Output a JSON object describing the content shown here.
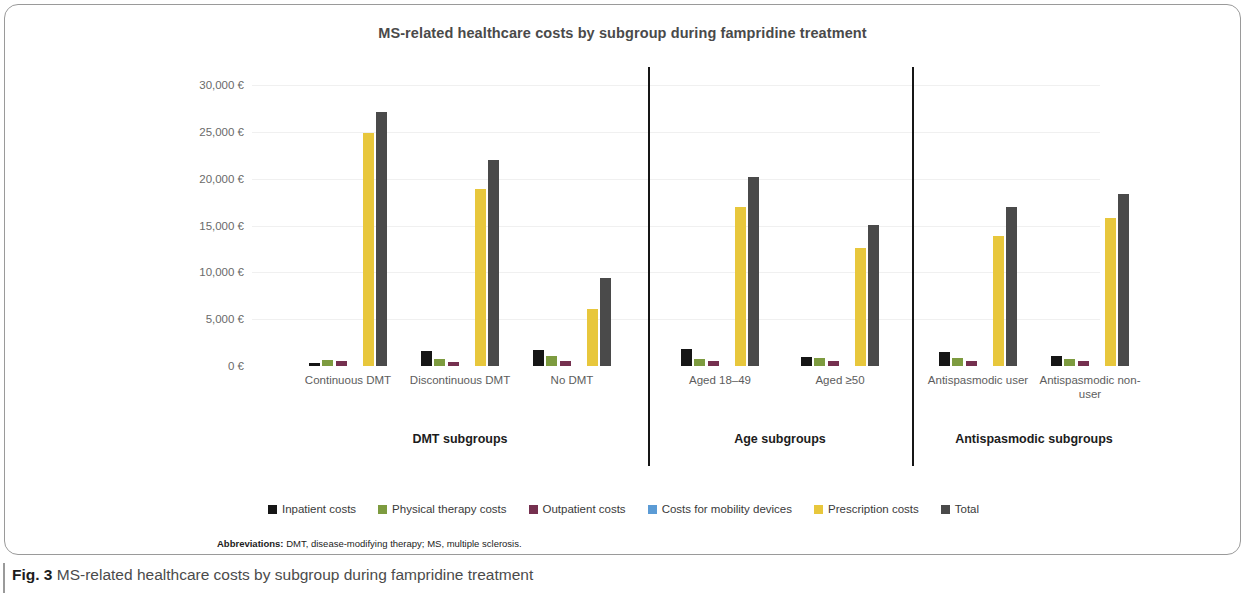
{
  "figure": {
    "number_label": "Fig. 3",
    "caption": "MS-related healthcare costs by subgroup during fampridine treatment",
    "abbreviations_label": "Abbreviations:",
    "abbreviations_text": "DMT, disease-modifying therapy; MS, multiple sclerosis."
  },
  "chart_data": {
    "type": "bar",
    "title": "MS-related healthcare costs by subgroup during fampridine treatment",
    "xlabel": "",
    "ylabel": "",
    "ylim": [
      0,
      30000
    ],
    "ytick_values": [
      0,
      5000,
      10000,
      15000,
      20000,
      25000,
      30000
    ],
    "ytick_labels": [
      "0 €",
      "5,000 €",
      "10,000 €",
      "15,000 €",
      "20,000 €",
      "25,000 €",
      "30,000 €"
    ],
    "grid": true,
    "legend_position": "bottom",
    "currency": "€",
    "categories": [
      "Continuous DMT",
      "Discontinuous DMT",
      "No DMT",
      "Aged 18–49",
      "Aged ≥50",
      "Antispasmodic user",
      "Antispasmodic non-user"
    ],
    "sections": [
      {
        "label": "DMT subgroups",
        "categories": [
          "Continuous DMT",
          "Discontinuous DMT",
          "No DMT"
        ]
      },
      {
        "label": "Age subgroups",
        "categories": [
          "Aged 18–49",
          "Aged ≥50"
        ]
      },
      {
        "label": "Antispasmodic subgroups",
        "categories": [
          "Antispasmodic user",
          "Antispasmodic non-user"
        ]
      }
    ],
    "series": [
      {
        "name": "Inpatient costs",
        "color": "#161616",
        "values": [
          300,
          1600,
          1700,
          1800,
          1000,
          1500,
          1100
        ]
      },
      {
        "name": "Physical therapy costs",
        "color": "#7d9b3f",
        "values": [
          600,
          700,
          1100,
          800,
          900,
          900,
          800
        ]
      },
      {
        "name": "Outpatient costs",
        "color": "#75304f",
        "values": [
          500,
          400,
          500,
          500,
          500,
          500,
          500
        ]
      },
      {
        "name": "Costs for mobility devices",
        "color": "#5b9bd5",
        "values": [
          0,
          0,
          0,
          0,
          0,
          0,
          0
        ]
      },
      {
        "name": "Prescription costs",
        "color": "#e6c githubc",
        "values": [
          24900,
          18900,
          6100,
          17000,
          12600,
          13900,
          15800
        ]
      },
      {
        "name": "Total",
        "color": "#4a4a4a",
        "values": [
          27100,
          22000,
          9400,
          20200,
          15100,
          17000,
          18400
        ]
      }
    ]
  }
}
